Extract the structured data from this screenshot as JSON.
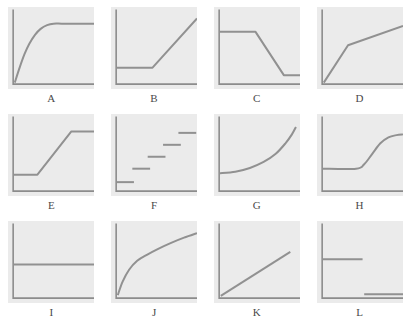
{
  "figure": {
    "kind": "multi-panel-line-graph-grid",
    "columns": 4,
    "rows": 3,
    "panel_background": "#ebebeb",
    "page_background": "#ffffff",
    "axis_color": "#8c8c8c",
    "line_color": "#919191",
    "label_color": "#4a4a4a"
  },
  "chart_data": [
    {
      "type": "line",
      "label": "A",
      "title": "",
      "xlabel": "",
      "ylabel": "",
      "xlim": [
        0,
        100
      ],
      "ylim": [
        0,
        100
      ],
      "grid": false,
      "legend": "none",
      "description": "rises steeply from origin then bends over to a high plateau",
      "points": [
        [
          2,
          2
        ],
        [
          8,
          22
        ],
        [
          14,
          40
        ],
        [
          20,
          54
        ],
        [
          27,
          66
        ],
        [
          34,
          74
        ],
        [
          42,
          79
        ],
        [
          50,
          81
        ],
        [
          60,
          81
        ],
        [
          75,
          81
        ],
        [
          100,
          81
        ]
      ]
    },
    {
      "type": "line",
      "label": "B",
      "title": "",
      "xlabel": "",
      "ylabel": "",
      "xlim": [
        0,
        100
      ],
      "ylim": [
        0,
        100
      ],
      "grid": false,
      "legend": "none",
      "description": "flat at a low level then a straight steep rise",
      "points": [
        [
          0,
          22
        ],
        [
          45,
          22
        ],
        [
          100,
          88
        ]
      ]
    },
    {
      "type": "line",
      "label": "C",
      "title": "",
      "xlabel": "",
      "ylabel": "",
      "xlim": [
        0,
        100
      ],
      "ylim": [
        0,
        100
      ],
      "grid": false,
      "legend": "none",
      "description": "high plateau then linear decline then low plateau",
      "points": [
        [
          0,
          70
        ],
        [
          45,
          70
        ],
        [
          80,
          12
        ],
        [
          100,
          12
        ]
      ]
    },
    {
      "type": "line",
      "label": "D",
      "title": "",
      "xlabel": "",
      "ylabel": "",
      "xlim": [
        0,
        100
      ],
      "ylim": [
        0,
        100
      ],
      "grid": false,
      "legend": "none",
      "description": "steep linear rise from origin then a shallower linear rise",
      "points": [
        [
          2,
          2
        ],
        [
          32,
          52
        ],
        [
          100,
          78
        ]
      ]
    },
    {
      "type": "line",
      "label": "E",
      "title": "",
      "xlabel": "",
      "ylabel": "",
      "xlim": [
        0,
        100
      ],
      "ylim": [
        0,
        100
      ],
      "grid": false,
      "legend": "none",
      "description": "low plateau then linear rise then high plateau",
      "points": [
        [
          0,
          22
        ],
        [
          30,
          22
        ],
        [
          72,
          80
        ],
        [
          100,
          80
        ]
      ]
    },
    {
      "type": "step",
      "label": "F",
      "title": "",
      "xlabel": "",
      "ylabel": "",
      "xlim": [
        0,
        100
      ],
      "ylim": [
        0,
        100
      ],
      "grid": false,
      "legend": "none",
      "description": "five detached ascending horizontal steps",
      "segments": [
        {
          "x0": 0,
          "x1": 22,
          "y": 12
        },
        {
          "x0": 20,
          "x1": 42,
          "y": 30
        },
        {
          "x0": 39,
          "x1": 61,
          "y": 46
        },
        {
          "x0": 58,
          "x1": 80,
          "y": 62
        },
        {
          "x0": 77,
          "x1": 99,
          "y": 78
        }
      ]
    },
    {
      "type": "line",
      "label": "G",
      "title": "",
      "xlabel": "",
      "ylabel": "",
      "xlim": [
        0,
        100
      ],
      "ylim": [
        0,
        100
      ],
      "grid": false,
      "legend": "none",
      "description": "nearly flat at a low level then accelerating exponential rise",
      "points": [
        [
          0,
          24
        ],
        [
          20,
          26
        ],
        [
          38,
          31
        ],
        [
          55,
          39
        ],
        [
          70,
          50
        ],
        [
          82,
          64
        ],
        [
          90,
          76
        ],
        [
          95,
          86
        ]
      ]
    },
    {
      "type": "line",
      "label": "H",
      "title": "",
      "xlabel": "",
      "ylabel": "",
      "xlim": [
        0,
        100
      ],
      "ylim": [
        0,
        100
      ],
      "grid": false,
      "legend": "none",
      "description": "flat low then sigmoid rise to a high plateau",
      "points": [
        [
          0,
          30
        ],
        [
          42,
          30
        ],
        [
          52,
          36
        ],
        [
          62,
          50
        ],
        [
          72,
          64
        ],
        [
          82,
          72
        ],
        [
          92,
          75
        ],
        [
          100,
          76
        ]
      ]
    },
    {
      "type": "line",
      "label": "I",
      "title": "",
      "xlabel": "",
      "ylabel": "",
      "xlim": [
        0,
        100
      ],
      "ylim": [
        0,
        100
      ],
      "grid": false,
      "legend": "none",
      "description": "constant horizontal line at mid height",
      "points": [
        [
          0,
          45
        ],
        [
          100,
          45
        ]
      ]
    },
    {
      "type": "line",
      "label": "J",
      "title": "",
      "xlabel": "",
      "ylabel": "",
      "xlim": [
        0,
        100
      ],
      "ylim": [
        0,
        100
      ],
      "grid": false,
      "legend": "none",
      "description": "logarithmic concave rise that flattens gradually",
      "points": [
        [
          2,
          4
        ],
        [
          8,
          22
        ],
        [
          16,
          38
        ],
        [
          26,
          50
        ],
        [
          38,
          58
        ],
        [
          52,
          66
        ],
        [
          68,
          74
        ],
        [
          84,
          81
        ],
        [
          100,
          87
        ]
      ]
    },
    {
      "type": "line",
      "label": "K",
      "title": "",
      "xlabel": "",
      "ylabel": "",
      "xlim": [
        0,
        100
      ],
      "ylim": [
        0,
        100
      ],
      "grid": false,
      "legend": "none",
      "description": "straight line rising from the origin at a constant moderate slope",
      "points": [
        [
          2,
          3
        ],
        [
          88,
          62
        ]
      ]
    },
    {
      "type": "step",
      "label": "L",
      "title": "",
      "xlabel": "",
      "ylabel": "",
      "xlim": [
        0,
        100
      ],
      "ylim": [
        0,
        100
      ],
      "grid": false,
      "legend": "none",
      "description": "two detached horizontal segments, a mid-level one on the left and a low one on the right",
      "segments": [
        {
          "x0": 0,
          "x1": 50,
          "y": 52
        },
        {
          "x0": 52,
          "x1": 100,
          "y": 5
        }
      ]
    }
  ],
  "panels": [
    {
      "label": "A"
    },
    {
      "label": "B"
    },
    {
      "label": "C"
    },
    {
      "label": "D"
    },
    {
      "label": "E"
    },
    {
      "label": "F"
    },
    {
      "label": "G"
    },
    {
      "label": "H"
    },
    {
      "label": "I"
    },
    {
      "label": "J"
    },
    {
      "label": "K"
    },
    {
      "label": "L"
    }
  ]
}
